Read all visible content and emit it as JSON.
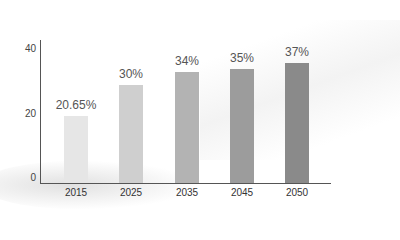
{
  "chart_data": {
    "type": "bar",
    "title": "",
    "xlabel": "",
    "ylabel": "",
    "ylim": [
      0,
      44
    ],
    "yticks": [
      0,
      20,
      40
    ],
    "categories": [
      "2015",
      "2025",
      "2035",
      "2045",
      "2050"
    ],
    "values": [
      20.65,
      30,
      34,
      35,
      37
    ],
    "data_labels": [
      "20.65%",
      "30%",
      "34%",
      "35%",
      "37%"
    ],
    "colors": [
      "#e6e6e6",
      "#cfcfcf",
      "#b3b3b3",
      "#9c9c9c",
      "#8a8a8a"
    ],
    "grid": false,
    "legend": null
  },
  "axis": {
    "yticks": [
      "40",
      "20",
      "0"
    ]
  }
}
